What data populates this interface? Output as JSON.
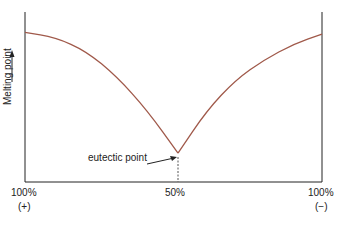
{
  "diagram": {
    "title": "",
    "y_axis_label": "Melting point",
    "x_labels": [
      {
        "pct": "100%",
        "sign": "(+)"
      },
      {
        "pct": "50%",
        "sign": ""
      },
      {
        "pct": "100%",
        "sign": "(−)"
      }
    ],
    "annotation": "eutectic point",
    "curve_color": "#a0594a",
    "axis_color": "#222222"
  },
  "chart_data": {
    "type": "line",
    "xlabel": "Composition",
    "ylabel": "Melting point",
    "x_ticks": [
      "100% (+)",
      "50%",
      "100% (−)"
    ],
    "series": [
      {
        "name": "left liquidus",
        "x": [
          0,
          0.1,
          0.2,
          0.3,
          0.4,
          0.5
        ],
        "y": [
          0.88,
          0.85,
          0.77,
          0.62,
          0.42,
          0.17
        ]
      },
      {
        "name": "right liquidus",
        "x": [
          0.5,
          0.6,
          0.7,
          0.8,
          0.9,
          1.0
        ],
        "y": [
          0.17,
          0.42,
          0.6,
          0.72,
          0.81,
          0.87
        ]
      }
    ],
    "annotations": [
      {
        "text": "eutectic point",
        "x": 0.5,
        "y": 0.17
      }
    ]
  }
}
